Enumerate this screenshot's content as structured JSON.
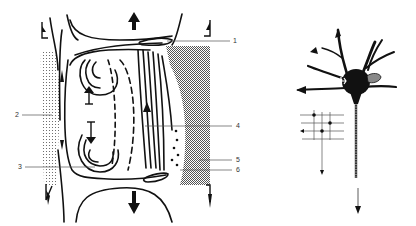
{
  "figure": {
    "left_panel": {
      "name": "tissue-section-schematic",
      "labels": [
        {
          "id": "1",
          "text": "1",
          "x": 233,
          "y": 12
        },
        {
          "id": "2",
          "text": "2",
          "x": 17,
          "y": 112
        },
        {
          "id": "3",
          "text": "3",
          "x": 20,
          "y": 165
        },
        {
          "id": "4",
          "text": "4",
          "x": 235,
          "y": 126
        },
        {
          "id": "5",
          "text": "5",
          "x": 235,
          "y": 158
        },
        {
          "id": "6",
          "text": "6",
          "x": 235,
          "y": 168
        }
      ]
    },
    "right_panel": {
      "name": "neuron-schematic"
    },
    "colors": {
      "ink": "#111111",
      "stipple": "#9a9a9a",
      "hatch": "#7a7a7a",
      "background": "#ffffff"
    }
  }
}
